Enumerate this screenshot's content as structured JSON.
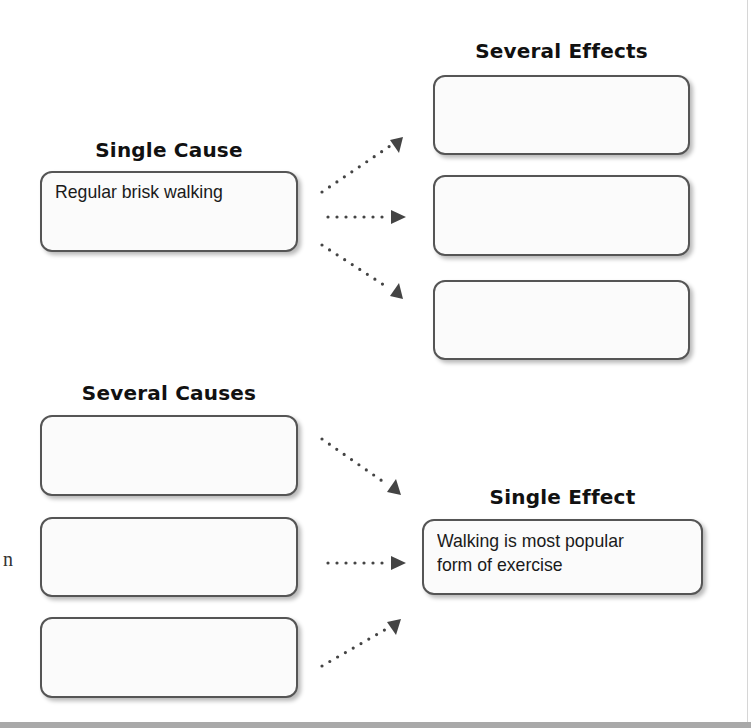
{
  "diagram": {
    "top_section": {
      "cause_heading": "Single Cause",
      "cause_box_text": "Regular brisk walking",
      "effects_heading": "Several Effects",
      "effect_boxes": [
        "",
        "",
        ""
      ]
    },
    "bottom_section": {
      "causes_heading": "Several Causes",
      "cause_boxes": [
        "",
        "",
        ""
      ],
      "effect_heading": "Single Effect",
      "effect_box_text_line1": "Walking is most popular",
      "effect_box_text_line2": "form of exercise"
    },
    "stray_margin_glyph": "n",
    "colors": {
      "box_border": "#555555",
      "box_fill": "#fbfbfb",
      "arrow": "#444444",
      "heading_text": "#111111",
      "bottom_bar": "#a9a9a9"
    },
    "arrows": [
      {
        "name": "cause-to-effect-1",
        "direction": "up-right"
      },
      {
        "name": "cause-to-effect-2",
        "direction": "right"
      },
      {
        "name": "cause-to-effect-3",
        "direction": "down-right"
      },
      {
        "name": "cause-1-to-effect",
        "direction": "down-right"
      },
      {
        "name": "cause-2-to-effect",
        "direction": "right"
      },
      {
        "name": "cause-3-to-effect",
        "direction": "up-right"
      }
    ]
  }
}
